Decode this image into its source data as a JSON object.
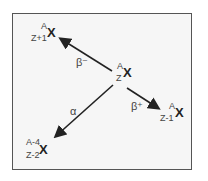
{
  "diagram": {
    "parent": {
      "A": "A",
      "Z": "Z",
      "symbol": "X"
    },
    "products": [
      {
        "mode": "β⁻",
        "A": "A",
        "Z": "Z+1",
        "symbol": "X"
      },
      {
        "mode": "β⁺",
        "A": "A",
        "Z": "Z-1",
        "symbol": "X"
      },
      {
        "mode": "α",
        "A": "A-4",
        "Z": "Z-2",
        "symbol": "X"
      }
    ],
    "colors": {
      "arrow": "#222222",
      "border": "#555555",
      "text": "#444444"
    }
  }
}
